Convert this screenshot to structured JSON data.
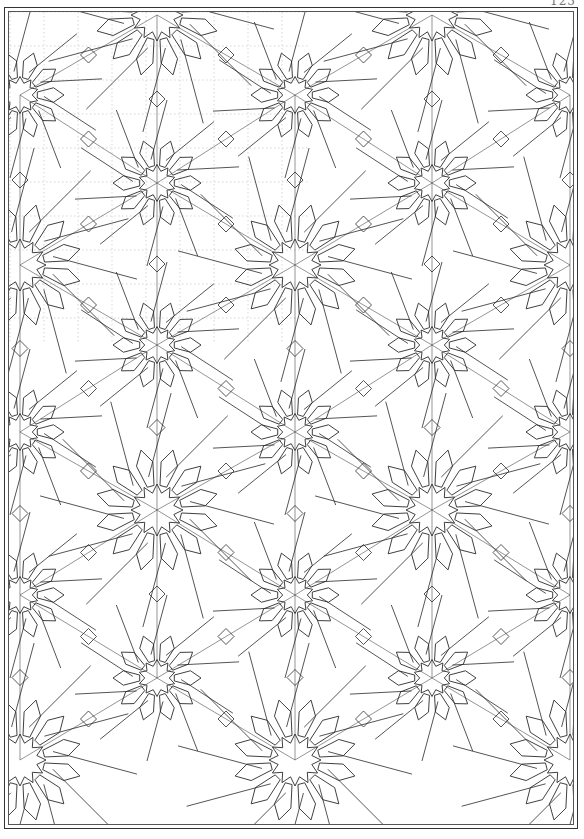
{
  "page": {
    "number": "123",
    "frame_color": "#333333",
    "line_color": "#2a2a2a",
    "construction_color": "#bdbdbd"
  },
  "pattern": {
    "description": "Islamic geometric interlace pattern with 10-fold and 12-fold rosettes",
    "large_rosettes": [
      {
        "x": 20,
        "y": 265
      },
      {
        "x": 295,
        "y": 265
      },
      {
        "x": 570,
        "y": 265
      },
      {
        "x": 157,
        "y": 510
      },
      {
        "x": 432,
        "y": 510
      },
      {
        "x": 20,
        "y": 760
      },
      {
        "x": 295,
        "y": 760
      },
      {
        "x": 570,
        "y": 760
      },
      {
        "x": 157,
        "y": 15
      },
      {
        "x": 432,
        "y": 15
      }
    ],
    "small_rosettes": [
      {
        "x": 295,
        "y": 95
      },
      {
        "x": 157,
        "y": 183
      },
      {
        "x": 432,
        "y": 183
      },
      {
        "x": 157,
        "y": 345
      },
      {
        "x": 432,
        "y": 345
      },
      {
        "x": 295,
        "y": 432
      },
      {
        "x": 20,
        "y": 432
      },
      {
        "x": 570,
        "y": 432
      },
      {
        "x": 295,
        "y": 595
      },
      {
        "x": 20,
        "y": 95
      },
      {
        "x": 570,
        "y": 95
      },
      {
        "x": 20,
        "y": 595
      },
      {
        "x": 570,
        "y": 595
      },
      {
        "x": 157,
        "y": 678
      },
      {
        "x": 432,
        "y": 678
      }
    ],
    "large_radius": 62,
    "small_radius": 44,
    "construction_region": {
      "x": 10,
      "y": 12,
      "w": 300,
      "h": 330
    }
  }
}
